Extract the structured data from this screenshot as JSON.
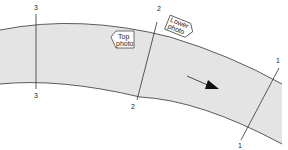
{
  "diagram": {
    "type": "river-channel-cross-sections",
    "colors": {
      "channel_fill": "#e4e4e4",
      "line": "#333333",
      "background": "#ffffff"
    },
    "sections": [
      {
        "id": "section-3",
        "top_label": "3",
        "bottom_label": "3"
      },
      {
        "id": "section-2",
        "top_label": "2",
        "bottom_label": "2"
      },
      {
        "id": "section-1",
        "top_label": "1",
        "bottom_label": "1"
      }
    ],
    "callouts": {
      "top_photo": {
        "line1": "Top",
        "line2": "photo"
      },
      "lower_photo": {
        "line1": "Lower",
        "line2": "photo"
      }
    },
    "flow_arrow": {
      "direction": "downstream"
    }
  }
}
